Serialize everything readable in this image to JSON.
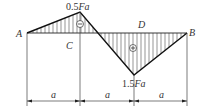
{
  "diagram": {
    "type": "moment diagram",
    "points": {
      "A": "A",
      "B": "B",
      "C": "C",
      "D": "D"
    },
    "values": {
      "peak_negative": {
        "number": "0.5",
        "symbol": "Fa"
      },
      "peak_positive": {
        "number": "1.5",
        "symbol": "Fa"
      }
    },
    "signs": {
      "left_region": "−",
      "right_region": "+"
    },
    "dimensions": [
      "a",
      "a",
      "a",
      "a"
    ],
    "colors": {
      "stroke": "#222222",
      "hatch": "#555555",
      "text": "#333333"
    }
  }
}
